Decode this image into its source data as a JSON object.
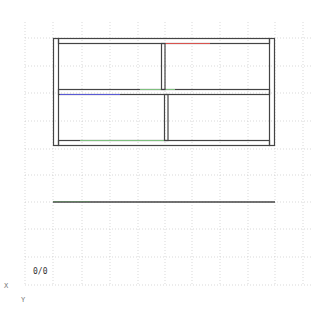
{
  "canvas": {
    "origin_label": "0/0",
    "axis_labels": {
      "x": "X",
      "y": "Y"
    },
    "grid": {
      "style": "dotted",
      "color": "#c8c8c8"
    },
    "colors": {
      "outline": "#444444",
      "highlight_red": "#d9534f",
      "highlight_blue": "#5a5ad6",
      "highlight_green": "#7fbf7f",
      "background": "#ffffff"
    }
  },
  "drawing": {
    "front_view": {
      "name": "shelf-front-view",
      "panels": [
        "left-side-panel",
        "right-side-panel"
      ],
      "shelves": [
        "top-shelf",
        "middle-shelf",
        "bottom-shelf"
      ],
      "dividers": [
        "upper-divider",
        "lower-divider"
      ]
    },
    "top_view": {
      "name": "shelf-top-view"
    }
  }
}
